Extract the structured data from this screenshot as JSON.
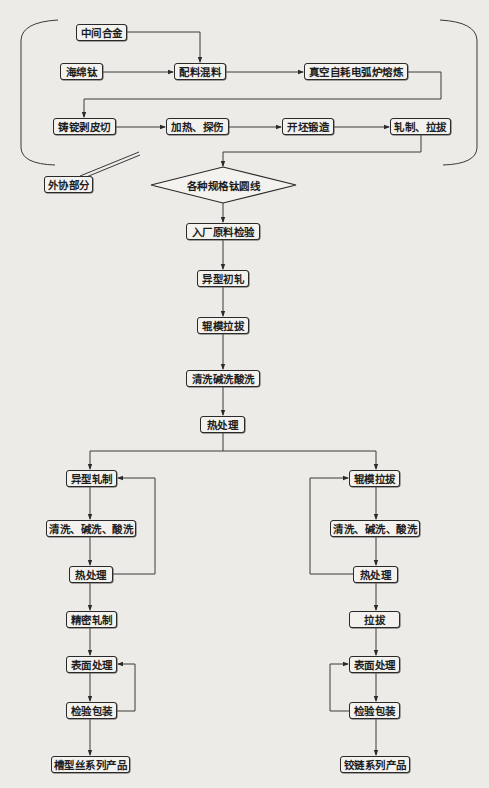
{
  "diagram": {
    "type": "flowchart",
    "colors": {
      "line": "#3a3a3a",
      "box_border": "#2a2a2a",
      "background": "#ecebe8"
    },
    "outsourced_label": "外协部分",
    "upstream": {
      "intermediate_alloy": "中间合金",
      "sponge_titanium": "海绵钛",
      "batching_mixing": "配料混料",
      "vacuum_arc_melting": "真空自耗电弧炉熔炼",
      "ingot_peeling_cutting": "铸锭剥皮切",
      "heating_inspection": "加热、探伤",
      "billet_forging": "开坯锻造",
      "rolling_drawing": "轧制、拉拔"
    },
    "decision": "各种规格钛圆线",
    "main": {
      "incoming_inspection": "入厂原料检验",
      "profile_rough_rolling": "异型初轧",
      "roller_die_drawing": "辊模拉拔",
      "cleaning": "清洗碱洗酸洗",
      "heat_treatment": "热处理"
    },
    "left_branch": {
      "profile_rolling": "异型轧制",
      "cleaning": "清洗、碱洗、酸洗",
      "heat_treatment": "热处理",
      "precision_rolling": "精密轧制",
      "surface_treatment": "表面处理",
      "inspection_packing": "检验包装",
      "product": "槽型丝系列产品"
    },
    "right_branch": {
      "roller_die_drawing": "辊模拉拔",
      "cleaning": "清洗、碱洗、酸洗",
      "heat_treatment": "热处理",
      "drawing": "拉拔",
      "surface_treatment": "表面处理",
      "inspection_packing": "检验包装",
      "product": "铰链系列产品"
    }
  }
}
